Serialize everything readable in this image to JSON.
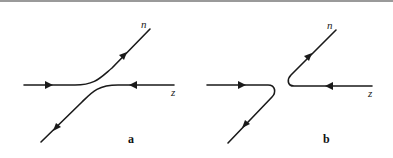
{
  "figure": {
    "panels": [
      {
        "id": "a",
        "label": "a",
        "description": "avoided crossing: incoming left line curves up to n; incoming right line from z curves down-left",
        "branch_labels": {
          "upper_right": "n",
          "right": "z"
        }
      },
      {
        "id": "b",
        "label": "b",
        "description": "sharp turn: incoming left line turns down-left; incoming right line from z turns up-right to n",
        "branch_labels": {
          "upper_right": "n",
          "right": "z"
        }
      }
    ],
    "colors": {
      "stroke": "#1a1a1a",
      "rule": "#9a9a9a",
      "background": "#ffffff"
    }
  }
}
